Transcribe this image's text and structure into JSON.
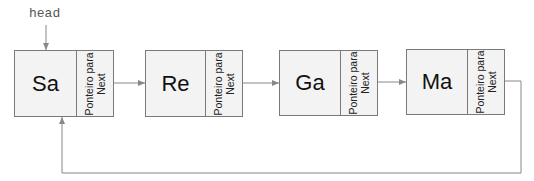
{
  "diagram": {
    "type": "circular-linked-list",
    "head_label": "head",
    "nodes": [
      {
        "value": "Sa",
        "pointer_label_line1": "Ponteiro para",
        "pointer_label_line2": "Next"
      },
      {
        "value": "Re",
        "pointer_label_line1": "Ponteiro para",
        "pointer_label_line2": "Next"
      },
      {
        "value": "Ga",
        "pointer_label_line1": "Ponteiro para",
        "pointer_label_line2": "Next"
      },
      {
        "value": "Ma",
        "pointer_label_line1": "Ponteiro para",
        "pointer_label_line2": "Next"
      }
    ],
    "edges": [
      {
        "from": "head",
        "to": "Sa"
      },
      {
        "from": "Sa",
        "to": "Re"
      },
      {
        "from": "Re",
        "to": "Ga"
      },
      {
        "from": "Ga",
        "to": "Ma"
      },
      {
        "from": "Ma",
        "to": "Sa"
      }
    ],
    "colors": {
      "node_fill": "#f3f3f3",
      "node_border": "#7a7a7a",
      "arrow": "#888888",
      "text": "#111111"
    }
  }
}
